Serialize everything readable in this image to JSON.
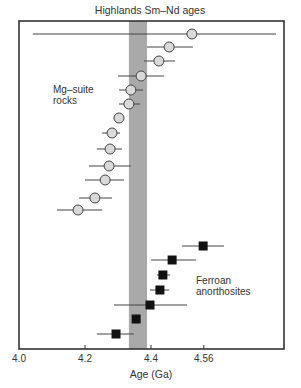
{
  "chart_data": {
    "type": "scatter",
    "title": "Highlands Sm–Nd ages",
    "xlabel": "Age (Ga)",
    "ylabel": "",
    "xlim": [
      4.0,
      4.806
    ],
    "grid": false,
    "legend": "none",
    "x_ticks": [
      {
        "value": 4.0,
        "label": "4.0"
      },
      {
        "value": 4.2,
        "label": "4.2"
      },
      {
        "value": 4.4,
        "label": "4.4"
      },
      {
        "value": 4.56,
        "label": "4.56"
      }
    ],
    "shaded_band": {
      "x_min": 4.333,
      "x_max": 4.388,
      "color": "#a9a9a9"
    },
    "series": [
      {
        "name": "Mg–suite rocks",
        "label_lines": [
          "Mg–suite",
          "rocks"
        ],
        "marker": "circle",
        "fill": "#d9d9d9",
        "points": [
          {
            "age": 4.524,
            "err_low": 4.042,
            "err_high": 4.779
          },
          {
            "age": 4.455,
            "err_low": 4.388,
            "err_high": 4.527
          },
          {
            "age": 4.424,
            "err_low": 4.379,
            "err_high": 4.473
          },
          {
            "age": 4.37,
            "err_low": 4.3,
            "err_high": 4.439
          },
          {
            "age": 4.339,
            "err_low": 4.303,
            "err_high": 4.376
          },
          {
            "age": 4.333,
            "err_low": 4.303,
            "err_high": 4.367
          },
          {
            "age": 4.303,
            "err_low": null,
            "err_high": null
          },
          {
            "age": 4.282,
            "err_low": 4.252,
            "err_high": 4.306
          },
          {
            "age": 4.276,
            "err_low": 4.236,
            "err_high": 4.312
          },
          {
            "age": 4.273,
            "err_low": 4.212,
            "err_high": 4.339
          },
          {
            "age": 4.261,
            "err_low": 4.2,
            "err_high": 4.318
          },
          {
            "age": 4.23,
            "err_low": 4.182,
            "err_high": 4.282
          },
          {
            "age": 4.179,
            "err_low": 4.115,
            "err_high": 4.252
          }
        ]
      },
      {
        "name": "Ferroan anorthosites",
        "label_lines": [
          "Ferroan",
          "anorthosites"
        ],
        "marker": "square",
        "fill": "#111111",
        "points": [
          {
            "age": 4.558,
            "err_low": 4.494,
            "err_high": 4.621
          },
          {
            "age": 4.464,
            "err_low": 4.4,
            "err_high": 4.536
          },
          {
            "age": 4.436,
            "err_low": 4.418,
            "err_high": 4.458
          },
          {
            "age": 4.427,
            "err_low": 4.397,
            "err_high": 4.455
          },
          {
            "age": 4.397,
            "err_low": 4.288,
            "err_high": 4.509
          },
          {
            "age": 4.355,
            "err_low": null,
            "err_high": null
          },
          {
            "age": 4.294,
            "err_low": 4.236,
            "err_high": 4.348
          }
        ]
      }
    ]
  },
  "layout": {
    "plot": {
      "left": 19,
      "top": 21,
      "right": 284,
      "bottom": 349
    },
    "px_per_ga": 330,
    "mg_rows_y": [
      34,
      47,
      61,
      76,
      90,
      104,
      118,
      133,
      149,
      166,
      180,
      198,
      210
    ],
    "fan_rows_y": [
      246,
      260,
      275,
      290,
      305,
      319,
      334
    ]
  }
}
